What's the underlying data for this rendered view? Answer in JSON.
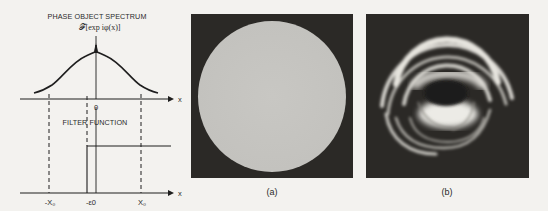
{
  "diagram": {
    "title": "PHASE OBJECT SPECTRUM",
    "formula": "𝓕[exp iφ(x)]",
    "top_axis": {
      "axis_label": "x",
      "origin_label": "0"
    },
    "filter_title": "FILTER FUNCTION",
    "bottom_axis": {
      "axis_label": "x",
      "tick_labels": [
        "-X₀",
        "-ε0",
        "X₀"
      ]
    }
  },
  "panels": [
    {
      "caption": "(a)",
      "description": "uniform bright disk on dark background"
    },
    {
      "caption": "(b)",
      "description": "filtered image showing concentric bright fringes with dark center"
    }
  ],
  "colors": {
    "background": "#f3f2ef",
    "ink": "#1e1e1e",
    "panel_dark": "#2b2926",
    "disk_gray": "#c6c5c1"
  }
}
